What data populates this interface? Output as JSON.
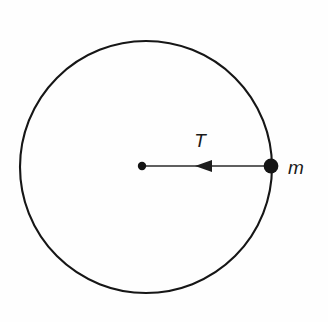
{
  "figure": {
    "background_color": "#fefefe",
    "stroke_color": "#161616",
    "labels": {
      "tension": "T",
      "mass": "m"
    },
    "geometry": {
      "circle": {
        "name": "circular-path",
        "center_x": 146,
        "center_y": 167,
        "radius": 126,
        "stroke_width": 2.1
      },
      "center_dot": {
        "name": "center-pivot",
        "cx": 142,
        "cy": 166,
        "r": 4.2
      },
      "mass_dot": {
        "name": "mass-particle",
        "cx": 271,
        "cy": 166,
        "r": 7.4
      },
      "tension_vector": {
        "name": "tension-arrow",
        "x_start": 271,
        "y_start": 166,
        "x_end": 145,
        "y_end": 166,
        "arrow_tip_x": 195,
        "arrow_tail_x": 211,
        "arrow_half_height": 6.2,
        "direction": "left"
      },
      "tension_label_position": {
        "x": 200,
        "y": 147
      },
      "mass_label_position": {
        "x": 288,
        "y": 174
      }
    }
  }
}
